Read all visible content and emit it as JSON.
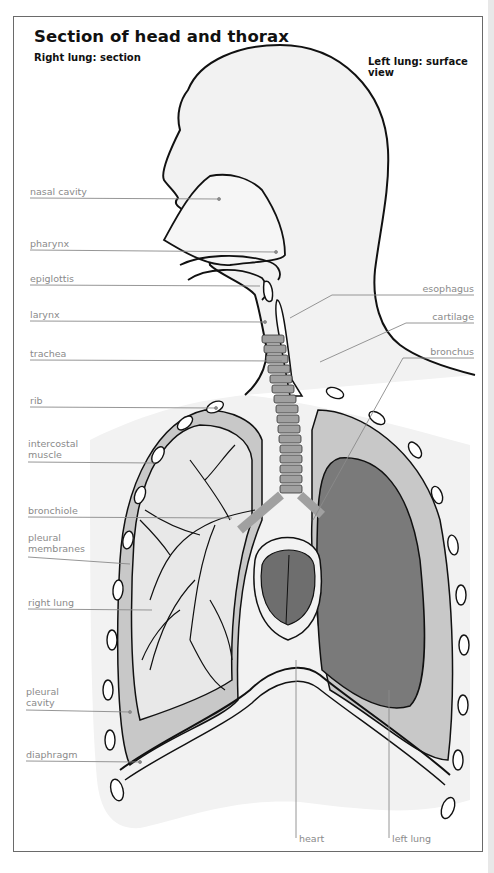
{
  "figure": {
    "title": "Section of head and thorax",
    "subtitle_left": "Right lung: section",
    "subtitle_right": "Left lung: surface view"
  },
  "labels_left": [
    {
      "id": "nasal-cavity",
      "text": "nasal cavity"
    },
    {
      "id": "pharynx",
      "text": "pharynx"
    },
    {
      "id": "epiglottis",
      "text": "epiglottis"
    },
    {
      "id": "larynx",
      "text": "larynx"
    },
    {
      "id": "trachea",
      "text": "trachea"
    },
    {
      "id": "rib",
      "text": "rib"
    },
    {
      "id": "intercostal-muscle",
      "text": "intercostal",
      "text2": "muscle"
    },
    {
      "id": "bronchiole",
      "text": "bronchiole"
    },
    {
      "id": "pleural-membranes",
      "text": "pleural",
      "text2": "membranes"
    },
    {
      "id": "right-lung",
      "text": "right lung"
    },
    {
      "id": "pleural-cavity",
      "text": "pleural",
      "text2": "cavity"
    },
    {
      "id": "diaphragm",
      "text": "diaphragm"
    }
  ],
  "labels_right": [
    {
      "id": "esophagus",
      "text": "esophagus"
    },
    {
      "id": "cartilage",
      "text": "cartilage"
    },
    {
      "id": "bronchus",
      "text": "bronchus"
    }
  ],
  "labels_bottom": [
    {
      "id": "heart",
      "text": "heart"
    },
    {
      "id": "left-lung",
      "text": "left lung"
    }
  ],
  "colors": {
    "frame": "#6a6a6a",
    "body_fill": "#f2f2f2",
    "pleural_fill": "#c8c8c8",
    "left_lung_fill": "#7a7a7a",
    "heart_fill": "#6e6e6e",
    "cartilage_fill": "#a0a0a0",
    "leader_line": "#8a8a8a"
  }
}
